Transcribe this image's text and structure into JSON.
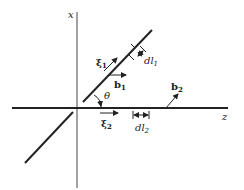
{
  "diagram": {
    "type": "dislocation-geometry",
    "axes": {
      "x_label": "x",
      "z_label": "z"
    },
    "line1": {
      "tangent_label": "ξ",
      "tangent_sub": "1",
      "burgers_label": "b",
      "burgers_sub": "1",
      "segment_label": "dl",
      "segment_sub": "1"
    },
    "line2": {
      "tangent_label": "ξ",
      "tangent_sub": "2",
      "burgers_label": "b",
      "burgers_sub": "2",
      "segment_label": "dl",
      "segment_sub": "2"
    },
    "angle_label": "θ",
    "colors": {
      "ink": "#222222",
      "background": "#ffffff"
    }
  }
}
